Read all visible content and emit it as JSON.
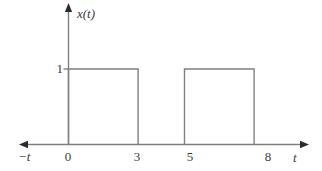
{
  "figure": {
    "title": "",
    "background_color": "#ffffff",
    "line_color": "#808080",
    "text_color": "#3c3c3c",
    "axis_arrow_color": "#2b2b2b"
  },
  "axes": {
    "y_axis_label": "x(t)",
    "x_axis_label_right": "t",
    "x_axis_label_left": "−t",
    "y_tick_label_1": "1"
  },
  "x_tick_labels": [
    {
      "value": 0,
      "label": "0",
      "px": 68
    },
    {
      "value": 3,
      "label": "3",
      "px": 137.5
    },
    {
      "value": 5,
      "label": "5",
      "px": 190
    },
    {
      "value": 8,
      "label": "8",
      "px": 267.5
    }
  ],
  "chart_data": {
    "type": "line",
    "title": "",
    "subtitle": "",
    "xlabel": "t",
    "ylabel": "x(t)",
    "xlim": [
      -2,
      10.5
    ],
    "ylim": [
      0,
      3.3
    ],
    "grid": false,
    "legend": null,
    "x_ticks": [
      0,
      3,
      5,
      8
    ],
    "x_tick_labels": [
      "0",
      "3",
      "5",
      "8"
    ],
    "y_ticks": [
      1
    ],
    "y_tick_labels": [
      "1"
    ],
    "annotations": [
      "−t",
      "t",
      "x(t)"
    ],
    "series": [
      {
        "name": "x(t)",
        "color": "#808080",
        "x": [
          -2,
          0,
          0,
          3,
          3,
          5,
          5,
          8,
          8,
          10.3
        ],
        "y": [
          0,
          0,
          1,
          1,
          0,
          0,
          1,
          1,
          0,
          0
        ]
      }
    ],
    "pulses": [
      {
        "start": 0,
        "end": 3,
        "amplitude": 1
      },
      {
        "start": 5,
        "end": 8,
        "amplitude": 1
      }
    ]
  }
}
